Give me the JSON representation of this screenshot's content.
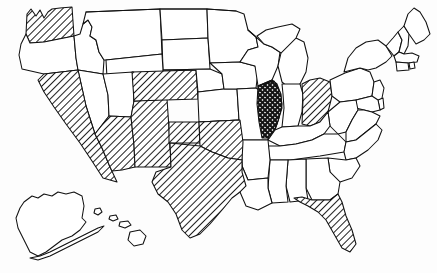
{
  "figure": {
    "type": "choropleth-map",
    "region": "United States of America",
    "title": "",
    "background_color": "#fdfdfd",
    "outline_color": "#111111",
    "rendering": "line-art black and white outline map with hatched state fills",
    "projection_note": "Alaska and Hawaii shown as insets at lower left"
  },
  "legend": {
    "visible": false,
    "patterns": [
      {
        "key": "plain",
        "label": "Not selected",
        "fill": "#ffffff"
      },
      {
        "key": "diagonal-hatch",
        "label": "Selected",
        "fill": "diagonal line hatching"
      },
      {
        "key": "cross-hatch",
        "label": "Selected (emphasis)",
        "fill": "cross hatching"
      }
    ]
  },
  "map_data": {
    "type": "map",
    "shading_patterns": [
      "plain",
      "diagonal-hatch",
      "cross-hatch"
    ],
    "highlighted_count": 10,
    "highlighted_states": [
      "Washington",
      "California",
      "Arizona",
      "New Mexico",
      "Colorado",
      "Oklahoma",
      "Texas",
      "Illinois",
      "Ohio",
      "Florida"
    ],
    "states": [
      {
        "code": "WA",
        "name": "Washington",
        "pattern": "diagonal-hatch"
      },
      {
        "code": "OR",
        "name": "Oregon",
        "pattern": "plain"
      },
      {
        "code": "ID",
        "name": "Idaho",
        "pattern": "plain"
      },
      {
        "code": "MT",
        "name": "Montana",
        "pattern": "plain"
      },
      {
        "code": "ND",
        "name": "North Dakota",
        "pattern": "plain"
      },
      {
        "code": "SD",
        "name": "South Dakota",
        "pattern": "plain"
      },
      {
        "code": "MN",
        "name": "Minnesota",
        "pattern": "plain"
      },
      {
        "code": "WI",
        "name": "Wisconsin",
        "pattern": "plain"
      },
      {
        "code": "MI",
        "name": "Michigan",
        "pattern": "plain"
      },
      {
        "code": "NY",
        "name": "New York",
        "pattern": "plain"
      },
      {
        "code": "VT",
        "name": "Vermont",
        "pattern": "plain"
      },
      {
        "code": "NH",
        "name": "New Hampshire",
        "pattern": "plain"
      },
      {
        "code": "ME",
        "name": "Maine",
        "pattern": "plain"
      },
      {
        "code": "MA",
        "name": "Massachusetts",
        "pattern": "plain"
      },
      {
        "code": "RI",
        "name": "Rhode Island",
        "pattern": "plain"
      },
      {
        "code": "CT",
        "name": "Connecticut",
        "pattern": "plain"
      },
      {
        "code": "PA",
        "name": "Pennsylvania",
        "pattern": "plain"
      },
      {
        "code": "NJ",
        "name": "New Jersey",
        "pattern": "plain"
      },
      {
        "code": "DE",
        "name": "Delaware",
        "pattern": "plain"
      },
      {
        "code": "MD",
        "name": "Maryland",
        "pattern": "plain"
      },
      {
        "code": "WV",
        "name": "West Virginia",
        "pattern": "plain"
      },
      {
        "code": "VA",
        "name": "Virginia",
        "pattern": "plain"
      },
      {
        "code": "OH",
        "name": "Ohio",
        "pattern": "diagonal-hatch"
      },
      {
        "code": "IN",
        "name": "Indiana",
        "pattern": "plain"
      },
      {
        "code": "IL",
        "name": "Illinois",
        "pattern": "cross-hatch"
      },
      {
        "code": "IA",
        "name": "Iowa",
        "pattern": "plain"
      },
      {
        "code": "NE",
        "name": "Nebraska",
        "pattern": "plain"
      },
      {
        "code": "WY",
        "name": "Wyoming",
        "pattern": "plain"
      },
      {
        "code": "UT",
        "name": "Utah",
        "pattern": "plain"
      },
      {
        "code": "NV",
        "name": "Nevada",
        "pattern": "plain"
      },
      {
        "code": "CA",
        "name": "California",
        "pattern": "diagonal-hatch"
      },
      {
        "code": "AZ",
        "name": "Arizona",
        "pattern": "diagonal-hatch"
      },
      {
        "code": "NM",
        "name": "New Mexico",
        "pattern": "diagonal-hatch"
      },
      {
        "code": "CO",
        "name": "Colorado",
        "pattern": "diagonal-hatch"
      },
      {
        "code": "KS",
        "name": "Kansas",
        "pattern": "plain"
      },
      {
        "code": "MO",
        "name": "Missouri",
        "pattern": "plain"
      },
      {
        "code": "KY",
        "name": "Kentucky",
        "pattern": "plain"
      },
      {
        "code": "TN",
        "name": "Tennessee",
        "pattern": "plain"
      },
      {
        "code": "NC",
        "name": "North Carolina",
        "pattern": "plain"
      },
      {
        "code": "SC",
        "name": "South Carolina",
        "pattern": "plain"
      },
      {
        "code": "GA",
        "name": "Georgia",
        "pattern": "plain"
      },
      {
        "code": "AL",
        "name": "Alabama",
        "pattern": "plain"
      },
      {
        "code": "MS",
        "name": "Mississippi",
        "pattern": "plain"
      },
      {
        "code": "AR",
        "name": "Arkansas",
        "pattern": "plain"
      },
      {
        "code": "LA",
        "name": "Louisiana",
        "pattern": "plain"
      },
      {
        "code": "OK",
        "name": "Oklahoma",
        "pattern": "diagonal-hatch"
      },
      {
        "code": "TX",
        "name": "Texas",
        "pattern": "diagonal-hatch"
      },
      {
        "code": "FL",
        "name": "Florida",
        "pattern": "diagonal-hatch"
      },
      {
        "code": "AK",
        "name": "Alaska",
        "pattern": "plain"
      },
      {
        "code": "HI",
        "name": "Hawaii",
        "pattern": "plain"
      }
    ]
  }
}
